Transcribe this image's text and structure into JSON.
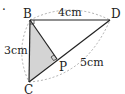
{
  "diagram": {
    "type": "geometry",
    "marker": "·",
    "points": {
      "B": "B",
      "D": "D",
      "C": "C",
      "P": "P"
    },
    "measurements": {
      "BD": "4cm",
      "BC": "3cm",
      "CD": "5cm"
    },
    "shaded_region": "triangle BCP",
    "right_angles": [
      "B",
      "P"
    ],
    "colors": {
      "line": "#222222",
      "shade": "#d4d4d4",
      "dashed_arc": "#9a9a9a"
    }
  }
}
